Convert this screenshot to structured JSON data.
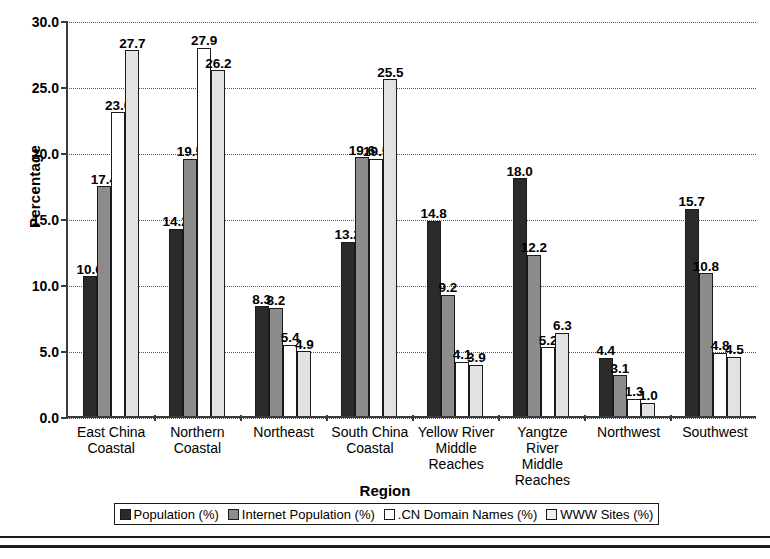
{
  "chart_data": {
    "type": "bar",
    "title": "",
    "xlabel": "Region",
    "ylabel": "Percentage",
    "ylim": [
      0,
      30
    ],
    "ytick_values": [
      0.0,
      5.0,
      10.0,
      15.0,
      20.0,
      25.0,
      30.0
    ],
    "ytick_labels": [
      "0.0",
      "5.0",
      "10.0",
      "15.0",
      "20.0",
      "25.0",
      "30.0"
    ],
    "grid": true,
    "grid_style": "dotted-horizontal",
    "legend_position": "bottom",
    "categories": [
      "East China Coastal",
      "Northern Coastal",
      "Northeast",
      "South China Coastal",
      "Yellow River Middle Reaches",
      "Yangtze River Middle Reaches",
      "Northwest",
      "Southwest"
    ],
    "series": [
      {
        "name": "Population (%)",
        "color": "#2b2b2b",
        "values": [
          10.6,
          14.2,
          8.3,
          13.2,
          14.8,
          18.0,
          4.4,
          15.7
        ],
        "labels": [
          "10.6",
          "14.2",
          "8.3",
          "13.2",
          "14.8",
          "18.0",
          "4.4",
          "15.7"
        ]
      },
      {
        "name": "Internet Population (%)",
        "color": "#8c8c8c",
        "values": [
          17.4,
          19.5,
          8.2,
          19.6,
          9.2,
          12.2,
          3.1,
          10.8
        ],
        "labels": [
          "17.4",
          "19.5",
          "8.2",
          "19.6",
          "9.2",
          "12.2",
          "3.1",
          "10.8"
        ]
      },
      {
        "name": ".CN Domain Names (%)",
        "color": "#ffffff",
        "values": [
          23.0,
          27.9,
          5.4,
          19.5,
          4.1,
          5.2,
          1.3,
          4.8
        ],
        "labels": [
          "23.0",
          "27.9",
          "5.4",
          "19.5",
          "4.1",
          "5.2",
          "1.3",
          "4.8"
        ]
      },
      {
        "name": "WWW Sites (%)",
        "color": "#e2e2e2",
        "values": [
          27.7,
          26.2,
          4.9,
          25.5,
          3.9,
          6.3,
          1.0,
          4.5
        ],
        "labels": [
          "27.7",
          "26.2",
          "4.9",
          "25.5",
          "3.9",
          "6.3",
          "1.0",
          "4.5"
        ]
      }
    ]
  },
  "axes": {
    "y_title": "Percentage",
    "x_title": "Region"
  },
  "xtick_lines": [
    [
      "East China",
      "Coastal"
    ],
    [
      "Northern",
      "Coastal"
    ],
    [
      "Northeast"
    ],
    [
      "South China",
      "Coastal"
    ],
    [
      "Yellow River",
      "Middle",
      "Reaches"
    ],
    [
      "Yangtze River",
      "Middle",
      "Reaches"
    ],
    [
      "Northwest"
    ],
    [
      "Southwest"
    ]
  ],
  "legend": {
    "items": [
      {
        "label": "Population (%)",
        "swatch": "s0"
      },
      {
        "label": "Internet Population (%)",
        "swatch": "s1"
      },
      {
        "label": ".CN Domain Names (%)",
        "swatch": "s2"
      },
      {
        "label": "WWW Sites (%)",
        "swatch": "s3"
      }
    ]
  },
  "colors": {
    "population": "#2b2b2b",
    "internet_population": "#8c8c8c",
    "cn_domain_names": "#ffffff",
    "www_sites": "#e2e2e2",
    "axis": "#3a3a3a",
    "grid": "#555555"
  }
}
